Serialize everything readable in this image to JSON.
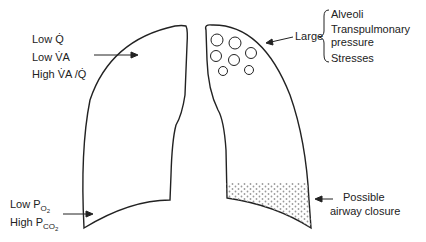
{
  "left_lung": {
    "apex_labels": [
      "Low Q̇",
      "Low V̇A",
      "High V̇A /Q̇"
    ],
    "base_labels": {
      "po2": {
        "prefix": "Low P",
        "sub": "O",
        "subsub": "2"
      },
      "pco2": {
        "prefix": "High P",
        "sub": "CO",
        "subsub": "2"
      }
    }
  },
  "right_lung": {
    "apex_label": "Large",
    "apex_items": [
      "Alveoli",
      "Transpulmonary",
      "pressure",
      "Stresses"
    ],
    "base_labels": [
      "Possible",
      "airway closure"
    ]
  },
  "colors": {
    "line": "#222222",
    "stipple": "#9a9a9a"
  }
}
